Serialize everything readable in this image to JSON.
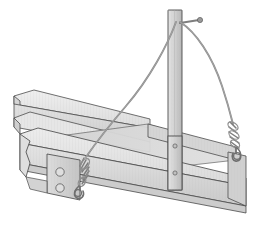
{
  "figure": {
    "type": "technical-line-illustration",
    "background_color": "#ffffff",
    "canvas": {
      "width": 253,
      "height": 230
    }
  },
  "palette": {
    "outline": "#4a4a4a",
    "outline_soft": "#6e6e6e",
    "concrete_top_light": "#e9e9e9",
    "concrete_face_mid": "#d8d8d8",
    "concrete_face_dark": "#c6c6c6",
    "concrete_inner_shadow": "#cfcfcf",
    "post_light": "#dcdcdc",
    "post_dark": "#bdbdbd",
    "cable": "#8a8a8a",
    "hardware": "#9a9a9a",
    "hardware_dark": "#6a6a6a",
    "bolt_fill": "#dedede",
    "caption_ghost": "#fbfbfb"
  },
  "parts": {
    "far_wall": {
      "name": "far side form wall",
      "note": "long light-gray panel running from lower-left to upper-right, chamfered left end"
    },
    "near_wall": {
      "name": "near side form wall",
      "note": "long panel in front with visible top edge and front face"
    },
    "inner_floor": {
      "name": "form interior floor",
      "note": "shaded channel between the two walls"
    },
    "end_plate": {
      "name": "left end bulkhead plate",
      "bolt_count": 2
    },
    "post": {
      "name": "vertical strongback post",
      "bolt_count": 2,
      "note": "tall rectangular upright crossing the form near the right third"
    },
    "top_pin": {
      "name": "post top anchor pin",
      "note": "short horizontal pin with rounded head projecting right from post top"
    },
    "cable_left": {
      "name": "left bracing cable",
      "note": "curves from post top down-left to the near wall corner fitting"
    },
    "cable_right": {
      "name": "right bracing cable",
      "note": "curves from post top down-right to the right end fitting"
    },
    "turnbuckle_left": {
      "name": "left turnbuckle and shackle assembly",
      "note": "coiled tensioner with hook anchoring into the left corner"
    },
    "turnbuckle_right": {
      "name": "right turnbuckle and shackle assembly",
      "note": "coiled tensioner with hook anchoring into the right end"
    }
  },
  "caption": {
    "text": "",
    "visible": false
  }
}
